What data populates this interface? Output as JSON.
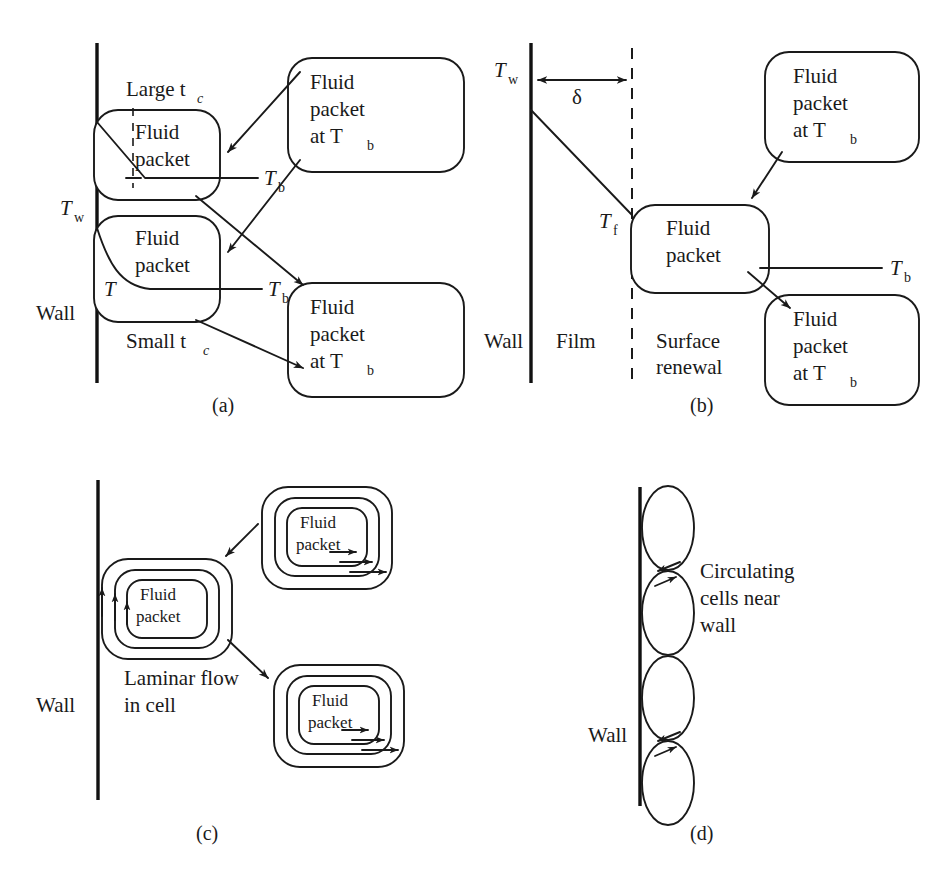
{
  "figure": {
    "panels": [
      {
        "id": "a",
        "label": "(a)",
        "caption": "Surface renewal / penetration model with contact times",
        "wall_label": "Wall",
        "labels": {
          "tw": "T",
          "tw_sub": "w",
          "t_sym": "T",
          "large_tc": "Large t",
          "large_tc_sub": "c",
          "small_tc": "Small t",
          "small_tc_sub": "c",
          "tb1": "T",
          "tb1_sub": "b",
          "tb2": "T",
          "tb2_sub": "b"
        },
        "packets": [
          {
            "name": "upper-wall-packet",
            "lines": [
              "Fluid",
              "packet"
            ]
          },
          {
            "name": "lower-wall-packet",
            "lines": [
              "Fluid",
              "packet"
            ]
          },
          {
            "name": "incoming-bulk-packet",
            "lines": [
              "Fluid",
              "packet",
              "at T"
            ],
            "sub": "b"
          },
          {
            "name": "outgoing-bulk-packet",
            "lines": [
              "Fluid",
              "packet",
              "at T"
            ],
            "sub": "b"
          }
        ]
      },
      {
        "id": "b",
        "label": "(b)",
        "caption": "Film plus surface renewal model",
        "zone_labels": [
          "Wall",
          "Film",
          "Surface",
          "renewal"
        ],
        "labels": {
          "tw": "T",
          "tw_sub": "w",
          "tf": "T",
          "tf_sub": "f",
          "t_sym": "T",
          "tb": "T",
          "tb_sub": "b",
          "delta": "δ"
        },
        "packets": [
          {
            "name": "film-edge-packet",
            "lines": [
              "Fluid",
              "packet"
            ]
          },
          {
            "name": "incoming-bulk-packet",
            "lines": [
              "Fluid",
              "packet",
              "at T"
            ],
            "sub": "b"
          },
          {
            "name": "outgoing-bulk-packet",
            "lines": [
              "Fluid",
              "packet",
              "at T"
            ],
            "sub": "b"
          }
        ]
      },
      {
        "id": "c",
        "label": "(c)",
        "caption": "Laminar flow in circulating cells",
        "wall_label": "Wall",
        "annotation": [
          "Laminar flow",
          "in cell"
        ],
        "packets": [
          {
            "name": "wall-cell-packet",
            "lines": [
              "Fluid",
              "packet"
            ]
          },
          {
            "name": "upper-cell-packet",
            "lines": [
              "Fluid",
              "packet"
            ]
          },
          {
            "name": "lower-cell-packet",
            "lines": [
              "Fluid",
              "packet"
            ]
          }
        ]
      },
      {
        "id": "d",
        "label": "(d)",
        "caption": "Circulating cells adjacent to the wall",
        "wall_label": "Wall",
        "annotation": [
          "Circulating",
          "cells near",
          "wall"
        ],
        "cell_count": 4
      }
    ]
  },
  "style": {
    "ink": "#1a1a1a",
    "wall_ink": "#111111",
    "background": "#ffffff"
  }
}
